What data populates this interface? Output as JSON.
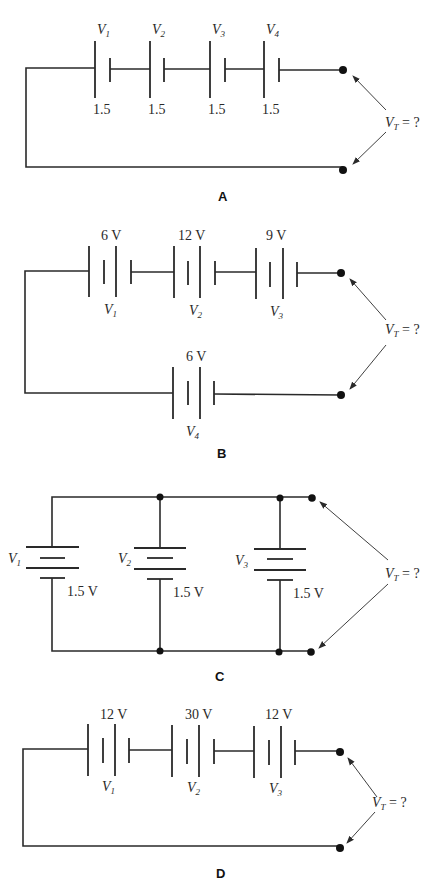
{
  "figures": [
    {
      "id": "A",
      "caption": "A",
      "type": "series",
      "cells": [
        {
          "name": "V",
          "sub": "1",
          "value": "1.5"
        },
        {
          "name": "V",
          "sub": "2",
          "value": "1.5"
        },
        {
          "name": "V",
          "sub": "3",
          "value": "1.5"
        },
        {
          "name": "V",
          "sub": "4",
          "value": "1.5"
        }
      ],
      "total_label": {
        "name": "V",
        "sub": "T",
        "rest": " = ?"
      }
    },
    {
      "id": "B",
      "caption": "B",
      "type": "series-two-rows",
      "cells": [
        {
          "name": "V",
          "sub": "1",
          "value": "6 V"
        },
        {
          "name": "V",
          "sub": "2",
          "value": "12 V"
        },
        {
          "name": "V",
          "sub": "3",
          "value": "9 V"
        },
        {
          "name": "V",
          "sub": "4",
          "value": "6 V"
        }
      ],
      "total_label": {
        "name": "V",
        "sub": "T",
        "rest": " = ?"
      }
    },
    {
      "id": "C",
      "caption": "C",
      "type": "parallel",
      "cells": [
        {
          "name": "V",
          "sub": "1",
          "value": "1.5 V"
        },
        {
          "name": "V",
          "sub": "2",
          "value": "1.5 V"
        },
        {
          "name": "V",
          "sub": "3",
          "value": "1.5 V"
        }
      ],
      "total_label": {
        "name": "V",
        "sub": "T",
        "rest": " = ?"
      }
    },
    {
      "id": "D",
      "caption": "D",
      "type": "series",
      "cells": [
        {
          "name": "V",
          "sub": "1",
          "value": "12 V"
        },
        {
          "name": "V",
          "sub": "2",
          "value": "30 V"
        },
        {
          "name": "V",
          "sub": "3",
          "value": "12 V"
        }
      ],
      "total_label": {
        "name": "V",
        "sub": "T",
        "rest": " = ?"
      }
    }
  ],
  "colors": {
    "line": "#2a2a2a",
    "background": "#ffffff"
  }
}
